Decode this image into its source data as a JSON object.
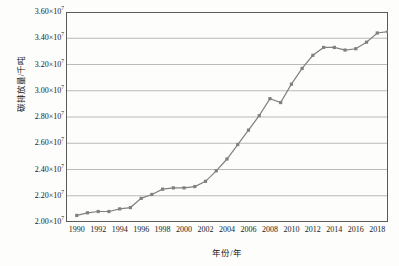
{
  "chart_data": {
    "type": "line",
    "title": "",
    "xlabel": "年份/年",
    "ylabel": "碳排放量/千吨",
    "xlim": [
      1989,
      2019
    ],
    "ylim": [
      20000000,
      36000000
    ],
    "grid": true,
    "legend": "none",
    "ytick_labels": [
      "3.60×10",
      "3.40×10",
      "3.20×10",
      "3.00×10",
      "2.80×10",
      "2.60×10",
      "2.40×10",
      "2.20×10",
      "2.00×10"
    ],
    "ytick_exponent": "7",
    "ytick_values": [
      36000000,
      34000000,
      32000000,
      30000000,
      28000000,
      26000000,
      24000000,
      22000000,
      20000000
    ],
    "xtick_labels": [
      "1990",
      "1992",
      "1994",
      "1996",
      "1998",
      "2000",
      "2002",
      "2004",
      "2006",
      "2008",
      "2010",
      "2012",
      "2014",
      "2016",
      "2018"
    ],
    "xtick_values": [
      1990,
      1992,
      1994,
      1996,
      1998,
      2000,
      2002,
      2004,
      2006,
      2008,
      2010,
      2012,
      2014,
      2016,
      2018
    ],
    "series": [
      {
        "name": "碳排放量",
        "color": "#808080",
        "marker": "square",
        "x": [
          1990,
          1991,
          1992,
          1993,
          1994,
          1995,
          1996,
          1997,
          1998,
          1999,
          2000,
          2001,
          2002,
          2003,
          2004,
          2005,
          2006,
          2007,
          2008,
          2009,
          2010,
          2011,
          2012,
          2013,
          2014,
          2015,
          2016,
          2017,
          2018,
          2019
        ],
        "values": [
          20500000,
          20700000,
          20800000,
          20800000,
          21000000,
          21100000,
          21800000,
          22100000,
          22500000,
          22600000,
          22600000,
          22700000,
          23100000,
          23900000,
          24800000,
          25900000,
          27000000,
          28100000,
          29400000,
          29100000,
          30500000,
          31700000,
          32700000,
          33300000,
          33300000,
          33100000,
          33200000,
          33700000,
          34400000,
          34500000
        ]
      }
    ]
  }
}
